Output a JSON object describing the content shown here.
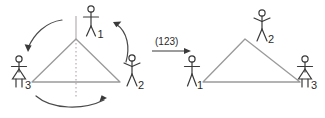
{
  "figure": {
    "type": "permutation-diagram",
    "colors": {
      "triangle_stroke": "#9a9a9a",
      "figure_stroke": "#3a3a3a",
      "arrow_stroke": "#4a4a4a",
      "symmetry_axis": "#b0a0a8",
      "text": "#2b2b2b",
      "background": "#ffffff"
    },
    "operation": {
      "label": "(123)",
      "arrow_name": "transition-arrow"
    },
    "left_diagram": {
      "name": "source-configuration",
      "symmetry_axis": true,
      "triangle": {
        "apex": [
          76,
          39
        ],
        "bottom_left": [
          32,
          82
        ],
        "bottom_right": [
          120,
          82
        ]
      },
      "vertices": [
        {
          "position": "top",
          "label": "1"
        },
        {
          "position": "bottom-right",
          "label": "2"
        },
        {
          "position": "bottom-left",
          "label": "3"
        }
      ],
      "rotation_arrows": [
        {
          "name": "rotation-arrow-left",
          "from": "top",
          "to": "bottom-left"
        },
        {
          "name": "rotation-arrow-bottom",
          "from": "bottom-left",
          "to": "bottom-right"
        },
        {
          "name": "rotation-arrow-right",
          "from": "bottom-right",
          "to": "top"
        }
      ]
    },
    "right_diagram": {
      "name": "result-configuration",
      "symmetry_axis": false,
      "triangle": {
        "apex": [
          245,
          39
        ],
        "bottom_left": [
          203,
          82
        ],
        "bottom_right": [
          300,
          82
        ]
      },
      "vertices": [
        {
          "position": "top",
          "label": "2"
        },
        {
          "position": "bottom-left",
          "label": "1"
        },
        {
          "position": "bottom-right",
          "label": "3"
        }
      ]
    }
  }
}
